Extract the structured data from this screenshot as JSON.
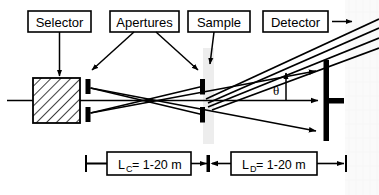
{
  "figure": {
    "background_color": "#ffffff",
    "line_color": "#000000",
    "sample_band_color": "#ededed",
    "watermark_color": "#f4f4f4"
  },
  "labels": {
    "selector": "Selector",
    "apertures": "Apertures",
    "sample": "Sample",
    "detector": "Detector"
  },
  "dimensions": {
    "collimation": {
      "symbol": "L",
      "subscript": "C",
      "equals": " = ",
      "value": "1-20 m",
      "full": "LC = 1-20 m"
    },
    "detector_distance": {
      "symbol": "L",
      "subscript": "D",
      "equals": " = ",
      "value": "1-20 m",
      "full": "LD = 1-20 m"
    }
  },
  "annotations": {
    "scattering_angle": "θ"
  },
  "components": {
    "velocity_selector": {
      "name": "velocity-selector",
      "fill": "hatched",
      "x": 33,
      "y": 78,
      "w": 47,
      "h": 45
    },
    "aperture_1": {
      "name": "collimation-aperture",
      "x": 87
    },
    "aperture_2": {
      "name": "sample-aperture",
      "x": 200
    },
    "sample_position": {
      "name": "sample",
      "x": 207
    },
    "detector_plane": {
      "name": "area-detector",
      "x": 327
    }
  }
}
